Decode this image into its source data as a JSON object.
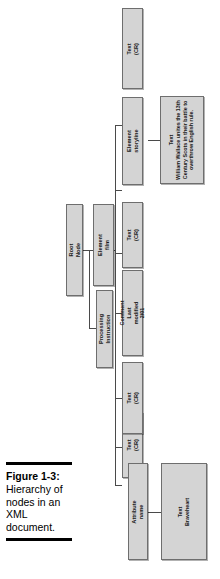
{
  "figure": {
    "label": "Figure 1-3:",
    "caption": "Hierarchy of nodes in an XML document."
  },
  "diagram": {
    "type": "tree",
    "orientation": "rotated-90-ccw",
    "nodes": [
      {
        "id": "root",
        "title": "Root Node",
        "detail": ""
      },
      {
        "id": "pi",
        "title": "Processing Instruction",
        "detail": ""
      },
      {
        "id": "element-film",
        "title": "Element",
        "detail": "film"
      },
      {
        "id": "text-cr-1",
        "title": "Text",
        "detail": "(CR)"
      },
      {
        "id": "comment",
        "title": "Comment",
        "detail": "Last modified 2/01"
      },
      {
        "id": "text-cr-2",
        "title": "Text",
        "detail": "(CR)"
      },
      {
        "id": "attribute",
        "title": "Attribute",
        "detail": "name"
      },
      {
        "id": "text-cr-3",
        "title": "Text",
        "detail": "(CR)"
      },
      {
        "id": "element-sl",
        "title": "Element",
        "detail": "storyline"
      },
      {
        "id": "text-cr-4",
        "title": "Text",
        "detail": "(CR)"
      },
      {
        "id": "text-brave",
        "title": "Text",
        "detail": "Braveheart"
      },
      {
        "id": "text-story",
        "title": "Text",
        "detail": "William Wallace unites the 13th Century Scots in their battle to overthrow English rule."
      }
    ],
    "edges": [
      {
        "from": "root",
        "to": "pi"
      },
      {
        "from": "root",
        "to": "element-film"
      },
      {
        "from": "element-film",
        "to": "text-cr-1"
      },
      {
        "from": "element-film",
        "to": "comment"
      },
      {
        "from": "element-film",
        "to": "text-cr-2"
      },
      {
        "from": "element-film",
        "to": "attribute"
      },
      {
        "from": "element-film",
        "to": "text-cr-3"
      },
      {
        "from": "element-film",
        "to": "element-sl"
      },
      {
        "from": "element-film",
        "to": "text-cr-4"
      },
      {
        "from": "attribute",
        "to": "text-brave"
      },
      {
        "from": "element-sl",
        "to": "text-story"
      }
    ]
  },
  "colors": {
    "box_fill": "#d4d4d4",
    "box_border": "#6e6e6e",
    "line": "#4a4a4a",
    "rule": "#000000",
    "text": "#1a1a1a"
  }
}
